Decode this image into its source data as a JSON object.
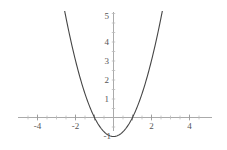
{
  "figure": {
    "width": 227,
    "height": 150,
    "background_color": "#ffffff"
  },
  "chart_data": {
    "type": "line",
    "title": "",
    "subtitle": "",
    "xlabel": "",
    "ylabel": "",
    "function": "y = x^2 - 1",
    "grid": false,
    "legend": null,
    "axis_color": "#aaaaaa",
    "curve_color": "#454545",
    "curve_width": 1.1,
    "xlim": [
      -5.0,
      5.2
    ],
    "ylim": [
      -1.4,
      5.3
    ],
    "x_ticks": [
      -4,
      -2,
      2,
      4
    ],
    "x_tick_labels": [
      "-4",
      "-2",
      "2",
      "4"
    ],
    "y_ticks": [
      1,
      2,
      3,
      4,
      5,
      -1
    ],
    "y_tick_labels": [
      "1",
      "2",
      "3",
      "4",
      "5",
      "-1"
    ],
    "minor_tick_step": 0.5,
    "vertex": [
      0,
      -1
    ],
    "roots": [
      -1,
      1
    ],
    "x_domain_drawn": [
      -3.25,
      3.25
    ],
    "series": [
      {
        "name": "parabola",
        "x": [
          -3.25,
          -3.0,
          -2.75,
          -2.5,
          -2.25,
          -2.0,
          -1.75,
          -1.5,
          -1.25,
          -1.0,
          -0.75,
          -0.5,
          -0.25,
          0,
          0.25,
          0.5,
          0.75,
          1.0,
          1.25,
          1.5,
          1.75,
          2.0,
          2.25,
          2.5,
          2.75,
          3.0,
          3.25
        ],
        "y": [
          9.5625,
          8.0,
          6.5625,
          5.25,
          4.0625,
          3.0,
          2.0625,
          1.25,
          0.5625,
          0.0,
          -0.4375,
          -0.75,
          -0.9375,
          -1.0,
          -0.9375,
          -0.75,
          -0.4375,
          0.0,
          0.5625,
          1.25,
          2.0625,
          3.0,
          4.0625,
          5.25,
          6.5625,
          8.0,
          9.5625
        ]
      }
    ]
  }
}
